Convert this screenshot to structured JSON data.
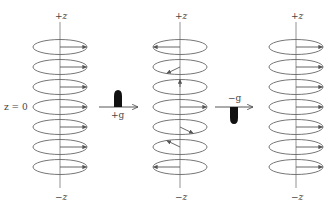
{
  "diagram": {
    "stacks": [
      {
        "id": "initial",
        "axis_top_label": "+z",
        "axis_bottom_label": "−z",
        "side_label": "z = 0",
        "center_x": 60,
        "vector_angles_deg": [
          0,
          0,
          0,
          0,
          0,
          0,
          0
        ]
      },
      {
        "id": "after-positive-gradient",
        "axis_top_label": "+z",
        "axis_bottom_label": "−z",
        "center_x": 180,
        "vector_angles_deg": [
          180,
          240,
          90,
          0,
          300,
          120,
          180
        ]
      },
      {
        "id": "after-negative-gradient",
        "axis_top_label": "+z",
        "axis_bottom_label": "−z",
        "center_x": 296,
        "vector_angles_deg": [
          0,
          0,
          0,
          0,
          0,
          0,
          0
        ]
      }
    ],
    "transitions": [
      {
        "id": "positive-gradient",
        "label": "+g",
        "pulse_direction": "up"
      },
      {
        "id": "negative-gradient",
        "label": "−g",
        "pulse_direction": "down"
      }
    ],
    "colors": {
      "ellipse": "#666666",
      "axis": "#777777",
      "vector": "#555555",
      "pulse": "#111111"
    }
  }
}
